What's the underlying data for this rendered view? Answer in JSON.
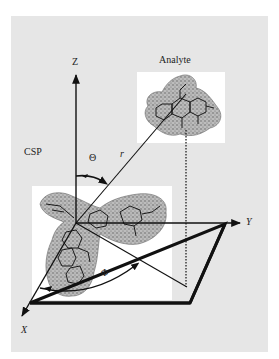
{
  "diagram": {
    "type": "3D spherical coordinate schematic",
    "labels": {
      "z_axis": "Z",
      "y_axis": "Y",
      "x_axis": "X",
      "csp": "CSP",
      "analyte": "Analyte",
      "theta": "Θ",
      "phi": "Φ",
      "r": "r"
    },
    "colors": {
      "panel_background": "#e6e6e6",
      "molecule_box": "#ffffff",
      "line": "#111111",
      "molecule_fill": "#9a9a9a"
    }
  }
}
